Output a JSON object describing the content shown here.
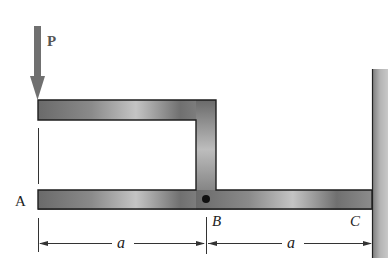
{
  "diagram": {
    "load": {
      "label": "P",
      "color": "#707070"
    },
    "points": {
      "A": "A",
      "B": "B",
      "C": "C"
    },
    "dimensions": [
      {
        "label": "a",
        "from": "A",
        "to": "B"
      },
      {
        "label": "a",
        "from": "B",
        "to": "C"
      }
    ],
    "colors": {
      "member_dark": "#5a5a5a",
      "member_light": "#c8c8c8",
      "outline": "#1e1e1e",
      "wall": "#a8a8a8",
      "dim_line": "#333333"
    }
  }
}
